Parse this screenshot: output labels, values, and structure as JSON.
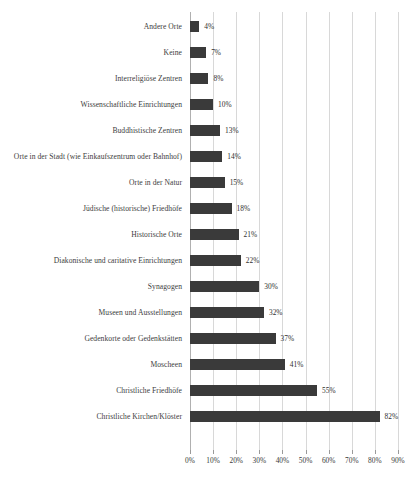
{
  "chart_data": {
    "type": "bar",
    "orientation": "horizontal",
    "title": "",
    "xlabel": "",
    "ylabel": "",
    "xlim": [
      0,
      90
    ],
    "grid": true,
    "legend": false,
    "value_suffix": "%",
    "categories": [
      "Andere Orte",
      "Keine",
      "Interreligiöse Zentren",
      "Wissenschaftliche Einrichtungen",
      "Buddhistische Zentren",
      "Orte in der Stadt (wie Einkaufszentrum oder Bahnhof)",
      "Orte in der Natur",
      "Jüdische (historische) Friedhöfe",
      "Historische Orte",
      "Diakonische und caritative Einrichtungen",
      "Synagogen",
      "Museen und Ausstellungen",
      "Gedenkorte oder Gedenkstätten",
      "Moscheen",
      "Christliche Friedhöfe",
      "Christliche Kirchen/Klöster"
    ],
    "values": [
      4,
      7,
      8,
      10,
      13,
      14,
      15,
      18,
      21,
      22,
      30,
      32,
      37,
      41,
      55,
      82
    ],
    "data_labels": [
      "4%",
      "7%",
      "8%",
      "10%",
      "13%",
      "14%",
      "15%",
      "18%",
      "21%",
      "22%",
      "30%",
      "32%",
      "37%",
      "41%",
      "55%",
      "82%"
    ],
    "xticks": [
      0,
      10,
      20,
      30,
      40,
      50,
      60,
      70,
      80,
      90
    ],
    "xtick_labels": [
      "0%",
      "10%",
      "20%",
      "30%",
      "40%",
      "50%",
      "60%",
      "70%",
      "80%",
      "90%"
    ],
    "bar_color": "#3a3a3a",
    "grid_color": "#d8d8d8",
    "axis_color": "#b0b0b0",
    "background": "#ffffff"
  }
}
